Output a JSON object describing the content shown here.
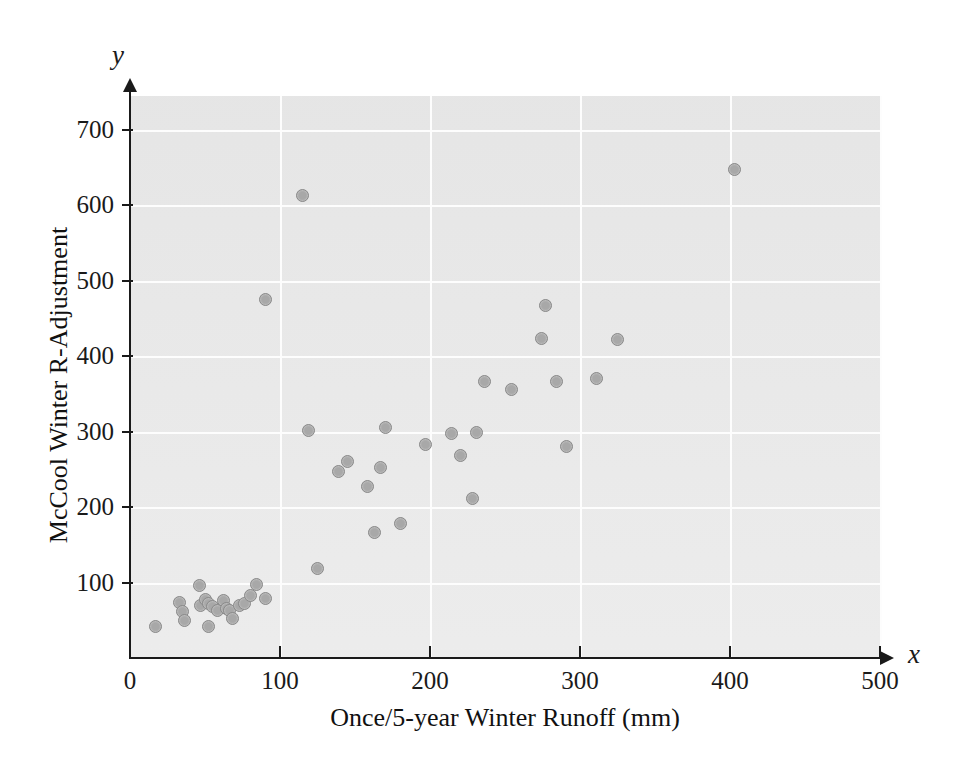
{
  "chart_data": {
    "type": "scatter",
    "title": "",
    "xlabel": "Once/5-year Winter Runoff (mm)",
    "ylabel": "McCool Winter R-Adjustment",
    "x_variable_symbol": "x",
    "y_variable_symbol": "y",
    "xlim": [
      0,
      500
    ],
    "ylim": [
      0,
      745
    ],
    "xticks": [
      0,
      100,
      200,
      300,
      400,
      500
    ],
    "xtick_labels": [
      "0",
      "100",
      "200",
      "300",
      "400",
      "500"
    ],
    "yticks": [
      100,
      200,
      300,
      400,
      500,
      600,
      700
    ],
    "ytick_labels": [
      "100",
      "200",
      "300",
      "400",
      "500",
      "600",
      "700"
    ],
    "grid": true,
    "grid_color": "#fdfdfd",
    "plot_background": "#ebebeb",
    "legend": null,
    "marker": {
      "shape": "circle",
      "fill_color": "#a8a8a8",
      "edge_color": "#8a8a8a",
      "size_px": 13
    },
    "points": [
      {
        "x": 17,
        "y": 42
      },
      {
        "x": 33,
        "y": 74
      },
      {
        "x": 35,
        "y": 62
      },
      {
        "x": 36,
        "y": 50
      },
      {
        "x": 46,
        "y": 96
      },
      {
        "x": 47,
        "y": 70
      },
      {
        "x": 50,
        "y": 78
      },
      {
        "x": 52,
        "y": 72
      },
      {
        "x": 52,
        "y": 42
      },
      {
        "x": 55,
        "y": 68
      },
      {
        "x": 58,
        "y": 63
      },
      {
        "x": 62,
        "y": 76
      },
      {
        "x": 64,
        "y": 66
      },
      {
        "x": 66,
        "y": 63
      },
      {
        "x": 68,
        "y": 53
      },
      {
        "x": 73,
        "y": 70
      },
      {
        "x": 76,
        "y": 72
      },
      {
        "x": 80,
        "y": 83
      },
      {
        "x": 84,
        "y": 98
      },
      {
        "x": 90,
        "y": 79
      },
      {
        "x": 90,
        "y": 475
      },
      {
        "x": 115,
        "y": 613
      },
      {
        "x": 119,
        "y": 301
      },
      {
        "x": 125,
        "y": 118
      },
      {
        "x": 139,
        "y": 247
      },
      {
        "x": 145,
        "y": 261
      },
      {
        "x": 158,
        "y": 228
      },
      {
        "x": 163,
        "y": 166
      },
      {
        "x": 167,
        "y": 252
      },
      {
        "x": 170,
        "y": 305
      },
      {
        "x": 180,
        "y": 178
      },
      {
        "x": 197,
        "y": 283
      },
      {
        "x": 214,
        "y": 297
      },
      {
        "x": 220,
        "y": 268
      },
      {
        "x": 228,
        "y": 211
      },
      {
        "x": 231,
        "y": 299
      },
      {
        "x": 236,
        "y": 366
      },
      {
        "x": 254,
        "y": 356
      },
      {
        "x": 274,
        "y": 424
      },
      {
        "x": 277,
        "y": 467
      },
      {
        "x": 284,
        "y": 366
      },
      {
        "x": 291,
        "y": 281
      },
      {
        "x": 311,
        "y": 371
      },
      {
        "x": 325,
        "y": 422
      },
      {
        "x": 403,
        "y": 648
      }
    ]
  }
}
